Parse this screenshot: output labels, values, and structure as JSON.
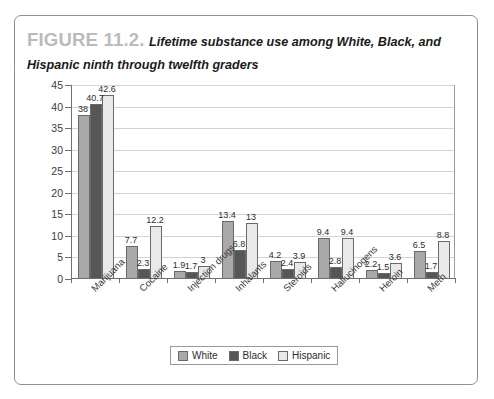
{
  "figure": {
    "label": "FIGURE 11.2.",
    "title": "Lifetime substance use among White, Black, and Hispanic ninth through twelfth graders"
  },
  "colors": {
    "white_series": "#a9a9a9",
    "black_series": "#565656",
    "hispanic_series": "#e9e9e9",
    "axis": "#6f6f6f",
    "gridline": "#d4d4d4",
    "frame_border": "#8c8f93",
    "figure_label": "#b9bbbd"
  },
  "legend": {
    "position": "bottom-center",
    "items": [
      {
        "label": "White",
        "color": "#a9a9a9"
      },
      {
        "label": "Black",
        "color": "#565656"
      },
      {
        "label": "Hispanic",
        "color": "#e9e9e9"
      }
    ]
  },
  "chart_data": {
    "type": "bar",
    "title": "Lifetime substance use among White, Black, and Hispanic ninth through twelfth graders",
    "xlabel": "",
    "ylabel": "",
    "ylim": [
      0,
      45
    ],
    "yticks": [
      0,
      5,
      10,
      15,
      20,
      25,
      30,
      35,
      40,
      45
    ],
    "ytick_labels": [
      "0",
      "5",
      "10",
      "15",
      "20",
      "25",
      "30",
      "35",
      "40",
      "45"
    ],
    "grid": true,
    "legend_position": "bottom",
    "categories": [
      "Marijuana",
      "Cocaine",
      "Injection drugs",
      "Inhalants",
      "Steroids",
      "Hallucinogens",
      "Heroin",
      "Meth"
    ],
    "series": [
      {
        "name": "White",
        "color": "#a9a9a9",
        "values": [
          38,
          7.7,
          1.9,
          13.4,
          4.2,
          9.4,
          2.2,
          6.5
        ],
        "labels": [
          "38",
          "7.7",
          "1.9",
          "13.4",
          "4.2",
          "9.4",
          "2.2",
          "6.5"
        ]
      },
      {
        "name": "Black",
        "color": "#565656",
        "values": [
          40.7,
          2.3,
          1.7,
          6.8,
          2.4,
          2.8,
          1.5,
          1.7
        ],
        "labels": [
          "40.7",
          "2.3",
          "1.7",
          "6.8",
          "2.4",
          "2.8",
          "1.5",
          "1.7"
        ]
      },
      {
        "name": "Hispanic",
        "color": "#e9e9e9",
        "values": [
          42.6,
          12.2,
          3,
          13,
          3.9,
          9.4,
          3.6,
          8.8
        ],
        "labels": [
          "42.6",
          "12.2",
          "3",
          "13",
          "3.9",
          "9.4",
          "3.6",
          "8.8"
        ]
      }
    ]
  }
}
